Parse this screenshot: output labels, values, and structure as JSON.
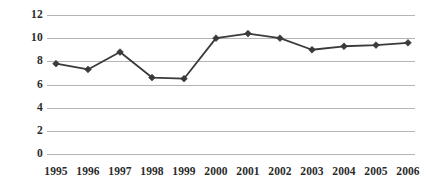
{
  "chart_data": {
    "type": "line",
    "title": "",
    "subtitle": "",
    "xlabel": "",
    "ylabel": "",
    "categories": [
      "1995",
      "1996",
      "1997",
      "1998",
      "1999",
      "2000",
      "2001",
      "2002",
      "2003",
      "2004",
      "2005",
      "2006"
    ],
    "values": [
      7.8,
      7.3,
      8.8,
      6.6,
      6.5,
      10.0,
      10.4,
      10.0,
      9.0,
      9.3,
      9.4,
      9.6
    ],
    "series": [
      {
        "name": "",
        "values": [
          7.8,
          7.3,
          8.8,
          6.6,
          6.5,
          10.0,
          10.4,
          10.0,
          9.0,
          9.3,
          9.4,
          9.6
        ],
        "marker": "diamond",
        "color": "#3a3a3a"
      }
    ],
    "ylim": [
      0,
      12
    ],
    "yticks": [
      0,
      2,
      4,
      6,
      8,
      10,
      12
    ],
    "ytick_labels": [
      "0",
      "2",
      "4",
      "6",
      "8",
      "10",
      "12"
    ],
    "xtick_labels": [
      "1995",
      "1996",
      "1997",
      "1998",
      "1999",
      "2000",
      "2001",
      "2002",
      "2003",
      "2004",
      "2005",
      "2006"
    ],
    "grid": true,
    "grid_axis": "y",
    "grid_color": "#b4b4b4",
    "legend": false,
    "legend_position": "none",
    "background_color": "#ffffff",
    "text_color": "#2b2b2b",
    "annotations": []
  },
  "layout": {
    "plot_left": 47,
    "plot_right": 415,
    "plot_top": 15,
    "plot_bottom": 154,
    "first_point_x": 56,
    "last_point_x": 408
  }
}
